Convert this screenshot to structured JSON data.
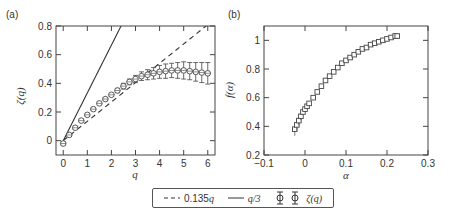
{
  "chart_data": [
    {
      "panel": "(a)",
      "type": "line",
      "xlabel": "q",
      "ylabel": "ζ(q)",
      "xlim": [
        -0.3,
        6.3
      ],
      "ylim": [
        -0.1,
        0.8
      ],
      "xticks": [
        "0",
        "1",
        "2",
        "3",
        "4",
        "5",
        "6"
      ],
      "yticks": [
        "0",
        "0.2",
        "0.4",
        "0.6",
        "0.8"
      ],
      "series": [
        {
          "name": "0.135q",
          "style": "dashed",
          "x": [
            0,
            6
          ],
          "y": [
            0,
            0.81
          ]
        },
        {
          "name": "q/3",
          "style": "solid",
          "x": [
            0,
            2.4
          ],
          "y": [
            0,
            0.8
          ]
        },
        {
          "name": "ζ(q)",
          "style": "circle-markers-errorbars",
          "x": [
            0,
            0.25,
            0.5,
            0.75,
            1,
            1.25,
            1.5,
            1.75,
            2,
            2.25,
            2.5,
            2.75,
            3,
            3.25,
            3.5,
            3.75,
            4,
            4.25,
            4.5,
            4.75,
            5,
            5.25,
            5.5,
            5.75,
            6
          ],
          "y": [
            -0.02,
            0.04,
            0.09,
            0.14,
            0.18,
            0.22,
            0.26,
            0.29,
            0.32,
            0.35,
            0.38,
            0.41,
            0.43,
            0.45,
            0.46,
            0.47,
            0.48,
            0.485,
            0.49,
            0.49,
            0.49,
            0.485,
            0.48,
            0.475,
            0.47
          ],
          "err": [
            0.01,
            0.01,
            0.01,
            0.01,
            0.01,
            0.01,
            0.01,
            0.01,
            0.01,
            0.015,
            0.02,
            0.02,
            0.025,
            0.03,
            0.035,
            0.04,
            0.045,
            0.05,
            0.05,
            0.055,
            0.06,
            0.06,
            0.065,
            0.07,
            0.075
          ]
        }
      ]
    },
    {
      "panel": "(b)",
      "type": "scatter",
      "xlabel": "α",
      "ylabel": "f(α)",
      "xlim": [
        -0.1,
        0.3
      ],
      "ylim": [
        0.2,
        1.1
      ],
      "xticks": [
        "-0.1",
        "0",
        "0.1",
        "0.2",
        "0.3"
      ],
      "yticks": [
        "0.2",
        "0.4",
        "0.6",
        "0.8",
        "1"
      ],
      "series": [
        {
          "name": "f(α)",
          "style": "square-markers-errorbars",
          "x": [
            -0.025,
            -0.02,
            -0.015,
            -0.01,
            -0.005,
            0,
            0.005,
            0.01,
            0.02,
            0.03,
            0.04,
            0.05,
            0.06,
            0.07,
            0.08,
            0.09,
            0.1,
            0.11,
            0.12,
            0.13,
            0.14,
            0.15,
            0.16,
            0.17,
            0.18,
            0.19,
            0.2,
            0.21,
            0.22,
            0.225
          ],
          "y": [
            0.38,
            0.41,
            0.44,
            0.47,
            0.5,
            0.52,
            0.54,
            0.56,
            0.6,
            0.64,
            0.68,
            0.72,
            0.75,
            0.78,
            0.81,
            0.84,
            0.86,
            0.88,
            0.9,
            0.92,
            0.94,
            0.95,
            0.97,
            0.98,
            0.99,
            1.0,
            1.01,
            1.02,
            1.03,
            1.03
          ]
        }
      ]
    }
  ],
  "legend": {
    "items": [
      "0.135",
      "q",
      "q/3",
      "ζ(q)"
    ]
  },
  "labels": {
    "panel_a": "(a)",
    "panel_b": "(b)",
    "a_ylabel": "ζ(q)",
    "a_xlabel": "q",
    "b_ylabel": "f(α)",
    "b_xlabel": "α"
  },
  "ticks": {
    "a_x": [
      "0",
      "1",
      "2",
      "3",
      "4",
      "5",
      "6"
    ],
    "a_y": [
      "0",
      "0.2",
      "0.4",
      "0.6",
      "0.8"
    ],
    "b_x": [
      "-0.1",
      "0",
      "0.1",
      "0.2",
      "0.3"
    ],
    "b_y": [
      "0.2",
      "0.4",
      "0.6",
      "0.8",
      "1"
    ]
  }
}
